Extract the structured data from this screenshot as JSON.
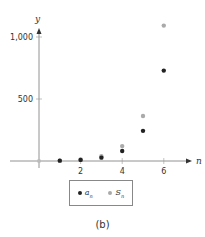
{
  "chart_data": {
    "type": "scatter",
    "title": "",
    "xlabel": "n",
    "ylabel": "y",
    "x": [
      1,
      2,
      3,
      4,
      5,
      6
    ],
    "series": [
      {
        "name": "a_n",
        "label": "a",
        "sub": "n",
        "color": "#222222",
        "values": [
          3,
          9,
          27,
          81,
          243,
          729
        ]
      },
      {
        "name": "S_n",
        "label": "S",
        "sub": "n",
        "color": "#aaaaaa",
        "values": [
          3,
          12,
          39,
          120,
          363,
          1092
        ]
      }
    ],
    "xticks": [
      2,
      4,
      6
    ],
    "xtick_labels": [
      "2",
      "4",
      "6"
    ],
    "yticks": [
      500,
      1000
    ],
    "ytick_labels": [
      "500",
      "1,000"
    ],
    "xlim": [
      0,
      6.5
    ],
    "ylim": [
      0,
      1150
    ],
    "grid": false,
    "legend_position": "bottom-center"
  },
  "caption": "(b)"
}
